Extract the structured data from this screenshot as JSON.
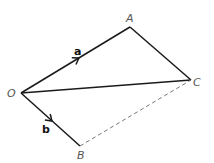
{
  "diagram": {
    "type": "vector-parallelogram",
    "points": {
      "O": {
        "label": "O",
        "x": 21,
        "y": 93
      },
      "A": {
        "label": "A",
        "x": 130,
        "y": 27
      },
      "C": {
        "label": "C",
        "x": 191,
        "y": 80
      },
      "B": {
        "label": "B",
        "x": 80,
        "y": 146
      }
    },
    "vectors": {
      "a": {
        "label": "a",
        "from": "O",
        "to": "A"
      },
      "b": {
        "label": "b",
        "from": "O",
        "to": "B"
      }
    },
    "segments": [
      {
        "from": "O",
        "to": "A",
        "style": "solid"
      },
      {
        "from": "A",
        "to": "C",
        "style": "solid"
      },
      {
        "from": "O",
        "to": "C",
        "style": "solid"
      },
      {
        "from": "O",
        "to": "B",
        "style": "solid"
      },
      {
        "from": "B",
        "to": "C",
        "style": "dashed"
      }
    ],
    "colors": {
      "line": "#1a1a1a",
      "dashed": "#777777",
      "point_label": "#555555",
      "vector_label": "#111111"
    }
  }
}
